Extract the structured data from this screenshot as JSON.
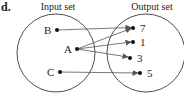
{
  "part_label": "d.",
  "input_set": {
    "title": "Input set",
    "elements": [
      "B",
      "A",
      "C"
    ]
  },
  "output_set": {
    "title": "Output set",
    "elements": [
      "7",
      "1",
      "3",
      "5"
    ]
  },
  "mappings": [
    {
      "from": "B",
      "to": "7"
    },
    {
      "from": "A",
      "to": "7"
    },
    {
      "from": "A",
      "to": "1"
    },
    {
      "from": "A",
      "to": "3"
    },
    {
      "from": "C",
      "to": "5"
    }
  ],
  "colors": {
    "ink": "#231f20",
    "arrow": "#555555"
  }
}
